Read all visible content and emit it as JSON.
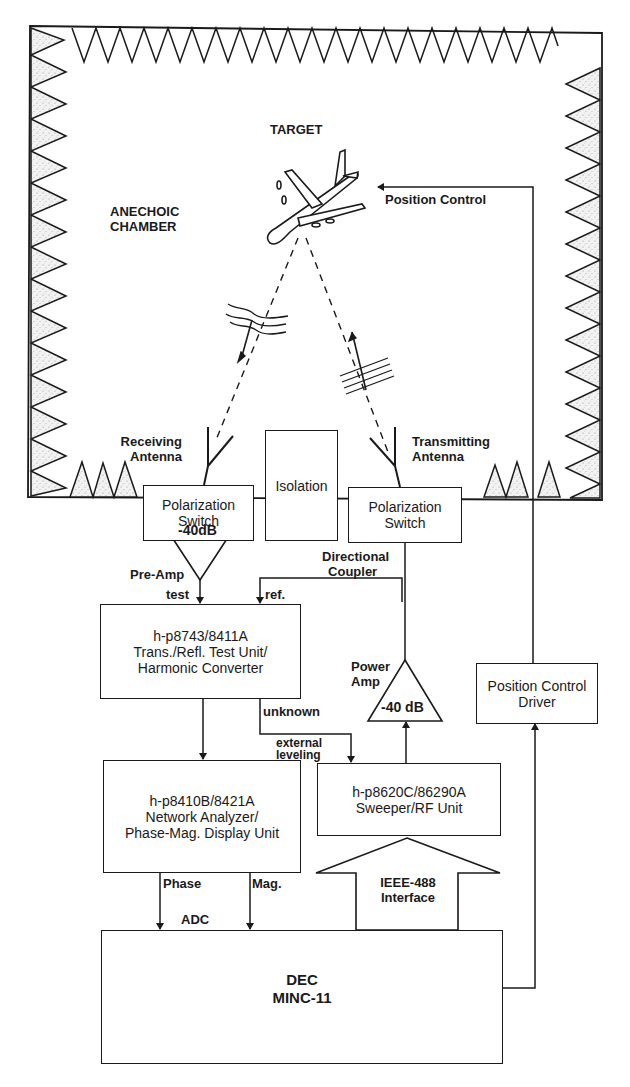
{
  "diagram": {
    "chamber": {
      "label_line1": "ANECHOIC",
      "label_line2": "CHAMBER"
    },
    "target": {
      "label": "TARGET"
    },
    "position_control": {
      "label": "Position Control"
    },
    "receiving_antenna": {
      "line1": "Receiving",
      "line2": "Antenna"
    },
    "transmitting_antenna": {
      "line1": "Transmitting",
      "line2": "Antenna"
    },
    "polarization_switch_left": {
      "line1": "Polarization",
      "line2": "Switch"
    },
    "isolation": {
      "label": "Isolation"
    },
    "polarization_switch_right": {
      "line1": "Polarization",
      "line2": "Switch"
    },
    "pre_amp": {
      "gain": "-40dB",
      "label": "Pre-Amp"
    },
    "directional_coupler": {
      "line1": "Directional",
      "line2": "Coupler"
    },
    "port_labels": {
      "test": "test",
      "ref": "ref.",
      "unknown": "unknown",
      "external_leveling_1": "external",
      "external_leveling_2": "leveling",
      "phase": "Phase",
      "mag": "Mag.",
      "adc": "ADC"
    },
    "test_unit": {
      "line1": "h-p8743/8411A",
      "line2": "Trans./Refl. Test Unit/",
      "line3": "Harmonic Converter"
    },
    "power_amp": {
      "line1": "Power",
      "line2": "Amp",
      "gain": "-40 dB"
    },
    "position_control_driver": {
      "line1": "Position Control",
      "line2": "Driver"
    },
    "network_analyzer": {
      "line1": "h-p8410B/8421A",
      "line2": "Network Analyzer/",
      "line3": "Phase-Mag. Display Unit"
    },
    "sweeper": {
      "line1": "h-p8620C/86290A",
      "line2": "Sweeper/RF Unit"
    },
    "ieee_interface": {
      "line1": "IEEE-488",
      "line2": "Interface"
    },
    "computer": {
      "line1": "DEC",
      "line2": "MINC-11"
    }
  }
}
